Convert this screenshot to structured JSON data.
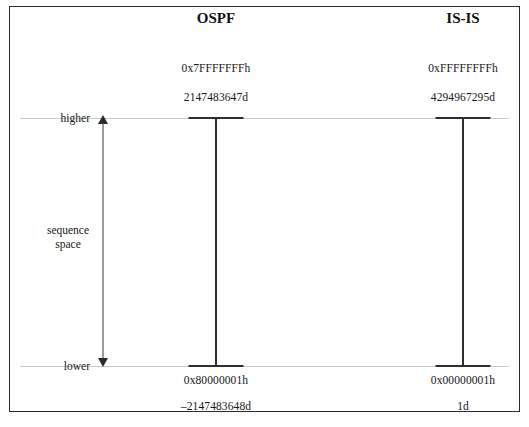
{
  "figure": {
    "columns": [
      {
        "id": "ospf",
        "title": "OSPF",
        "center_x": 216,
        "max_hex": "0x7FFFFFFFh",
        "max_dec": "2147483647d",
        "min_hex": "0x80000001h",
        "min_dec": "–2147483648d"
      },
      {
        "id": "isis",
        "title": "IS-IS",
        "center_x": 463,
        "max_hex": "0xFFFFFFFFh",
        "max_dec": "4294967295d",
        "min_hex": "0x00000001h",
        "min_dec": "1d"
      }
    ],
    "axis": {
      "top_label": "higher",
      "bottom_label": "lower",
      "caption_line1": "sequence",
      "caption_line2": "space"
    },
    "colors": {
      "frame": "#2b2b2b",
      "bar": "#2f2f2f",
      "guide": "#c9c9c9",
      "text": "#161616",
      "background": "#ffffff"
    }
  }
}
